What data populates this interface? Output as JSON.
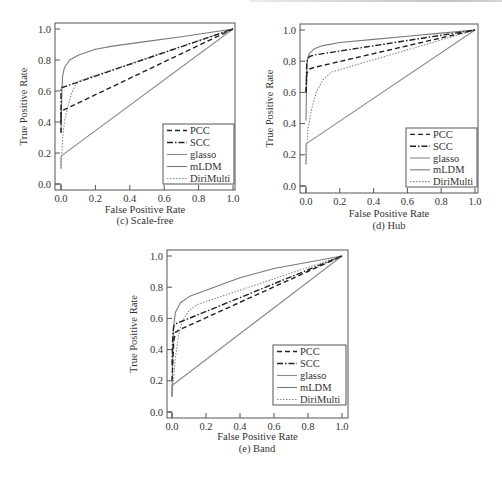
{
  "chart_data": [
    {
      "id": "c",
      "type": "line",
      "title": "",
      "caption": "(c)  Scale-free",
      "xlabel": "False Positive Rate",
      "ylabel": "True Positive Rate",
      "xlim": [
        0,
        1
      ],
      "ylim": [
        0,
        1
      ],
      "xticks": [
        "0.0",
        "0.2",
        "0.4",
        "0.6",
        "0.8",
        "1.0"
      ],
      "yticks": [
        "0.0",
        "0.2",
        "0.4",
        "0.6",
        "0.8",
        "1.0"
      ],
      "legend": {
        "position": "lower right",
        "entries": [
          "PCC",
          "SCC",
          "glasso",
          "mLDM",
          "DiriMulti"
        ]
      },
      "grid": false,
      "series": [
        {
          "name": "PCC",
          "style": "dashed",
          "color": "#222222",
          "x": [
            0.0,
            0.0,
            1.0
          ],
          "y": [
            0.33,
            0.47,
            1.0
          ]
        },
        {
          "name": "SCC",
          "style": "dashdot",
          "color": "#222222",
          "x": [
            0.0,
            0.0,
            1.0
          ],
          "y": [
            0.4,
            0.62,
            1.0
          ]
        },
        {
          "name": "glasso",
          "style": "solid",
          "color": "#8a8a8a",
          "x": [
            0.0,
            0.0,
            1.0
          ],
          "y": [
            0.1,
            0.18,
            1.0
          ]
        },
        {
          "name": "mLDM",
          "style": "solid",
          "color": "#7a7a7a",
          "x": [
            0.0,
            0.005,
            0.01,
            0.02,
            0.05,
            0.1,
            0.15,
            0.2,
            0.3,
            0.5,
            0.7,
            1.0
          ],
          "y": [
            0.33,
            0.6,
            0.7,
            0.75,
            0.8,
            0.83,
            0.85,
            0.87,
            0.89,
            0.92,
            0.95,
            1.0
          ]
        },
        {
          "name": "DiriMulti",
          "style": "dotted",
          "color": "#8a8a8a",
          "x": [
            0.0,
            0.01,
            0.02,
            0.04,
            0.06,
            0.08,
            0.1,
            0.12,
            1.0
          ],
          "y": [
            0.1,
            0.3,
            0.4,
            0.5,
            0.58,
            0.63,
            0.66,
            0.67,
            1.0
          ]
        }
      ]
    },
    {
      "id": "d",
      "type": "line",
      "title": "",
      "caption": "(d)  Hub",
      "xlabel": "False Positive Rate",
      "ylabel": "True Positive Rate",
      "xlim": [
        0,
        1
      ],
      "ylim": [
        0,
        1
      ],
      "xticks": [
        "0.0",
        "0.2",
        "0.4",
        "0.6",
        "0.8",
        "1.0"
      ],
      "yticks": [
        "0.0",
        "0.2",
        "0.4",
        "0.6",
        "0.8",
        "1.0"
      ],
      "legend": {
        "position": "lower right",
        "entries": [
          "PCC",
          "SCC",
          "glasso",
          "mLDM",
          "DiriMulti"
        ]
      },
      "grid": false,
      "series": [
        {
          "name": "PCC",
          "style": "dashed",
          "color": "#222222",
          "x": [
            0.0,
            0.005,
            0.02,
            0.05,
            1.0
          ],
          "y": [
            0.6,
            0.72,
            0.75,
            0.76,
            1.0
          ]
        },
        {
          "name": "SCC",
          "style": "dashdot",
          "color": "#222222",
          "x": [
            0.0,
            0.005,
            0.02,
            0.05,
            1.0
          ],
          "y": [
            0.6,
            0.8,
            0.83,
            0.84,
            1.0
          ]
        },
        {
          "name": "glasso",
          "style": "solid",
          "color": "#8a8a8a",
          "x": [
            0.0,
            0.0,
            1.0
          ],
          "y": [
            0.14,
            0.27,
            1.0
          ]
        },
        {
          "name": "mLDM",
          "style": "solid",
          "color": "#7a7a7a",
          "x": [
            0.0,
            0.005,
            0.01,
            0.02,
            0.05,
            0.1,
            0.2,
            0.4,
            0.6,
            0.8,
            1.0
          ],
          "y": [
            0.42,
            0.75,
            0.82,
            0.85,
            0.88,
            0.9,
            0.92,
            0.94,
            0.96,
            0.98,
            1.0
          ]
        },
        {
          "name": "DiriMulti",
          "style": "dotted",
          "color": "#8a8a8a",
          "x": [
            0.0,
            0.01,
            0.03,
            0.06,
            0.1,
            0.15,
            1.0
          ],
          "y": [
            0.14,
            0.35,
            0.48,
            0.6,
            0.68,
            0.73,
            1.0
          ]
        }
      ]
    },
    {
      "id": "e",
      "type": "line",
      "title": "",
      "caption": "(e)  Band",
      "xlabel": "False Positive Rate",
      "ylabel": "True Positive Rate",
      "xlim": [
        0,
        1
      ],
      "ylim": [
        0,
        1
      ],
      "xticks": [
        "0.0",
        "0.2",
        "0.4",
        "0.6",
        "0.8",
        "1.0"
      ],
      "yticks": [
        "0.0",
        "0.2",
        "0.4",
        "0.6",
        "0.8",
        "1.0"
      ],
      "legend": {
        "position": "lower right",
        "entries": [
          "PCC",
          "SCC",
          "glasso",
          "mLDM",
          "DiriMulti"
        ]
      },
      "grid": false,
      "series": [
        {
          "name": "PCC",
          "style": "dashed",
          "color": "#222222",
          "x": [
            0.0,
            0.01,
            0.02,
            0.05,
            1.0
          ],
          "y": [
            0.2,
            0.45,
            0.51,
            0.53,
            1.0
          ]
        },
        {
          "name": "SCC",
          "style": "dashdot",
          "color": "#222222",
          "x": [
            0.0,
            0.005,
            0.01,
            0.03,
            0.1,
            1.0
          ],
          "y": [
            0.3,
            0.5,
            0.55,
            0.57,
            0.6,
            1.0
          ]
        },
        {
          "name": "glasso",
          "style": "solid",
          "color": "#8a8a8a",
          "x": [
            0.0,
            0.0,
            1.0
          ],
          "y": [
            0.1,
            0.17,
            1.0
          ]
        },
        {
          "name": "mLDM",
          "style": "solid",
          "color": "#7a7a7a",
          "x": [
            0.0,
            0.005,
            0.01,
            0.02,
            0.05,
            0.1,
            0.2,
            0.4,
            0.6,
            0.8,
            1.0
          ],
          "y": [
            0.1,
            0.4,
            0.55,
            0.64,
            0.7,
            0.74,
            0.78,
            0.86,
            0.92,
            0.96,
            1.0
          ]
        },
        {
          "name": "DiriMulti",
          "style": "dotted",
          "color": "#8a8a8a",
          "x": [
            0.0,
            0.02,
            0.04,
            0.06,
            0.1,
            0.15,
            1.0
          ],
          "y": [
            0.1,
            0.35,
            0.5,
            0.58,
            0.65,
            0.69,
            1.0
          ]
        }
      ]
    }
  ],
  "layout": {
    "panels": [
      {
        "left": 0,
        "top": 0,
        "plot": {
          "x0": 61,
          "x1": 233,
          "y0": 184,
          "y1": 29,
          "fl": 55,
          "ft": 23,
          "fr": 235,
          "fb": 190
        },
        "legend": {
          "x": 163,
          "y": 124,
          "w": 71,
          "h": 60
        },
        "ylabel_x": 27,
        "xlabel_y": 213,
        "caption": {
          "x": 145,
          "y": 224
        }
      },
      {
        "left": 0,
        "top": 0,
        "plot": {
          "x0": 306,
          "x1": 475,
          "y0": 186,
          "y1": 30,
          "fl": 300,
          "ft": 24,
          "fr": 478,
          "fb": 193
        },
        "legend": {
          "x": 406,
          "y": 128,
          "w": 71,
          "h": 59
        },
        "ylabel_x": 273,
        "xlabel_y": 217,
        "caption": {
          "x": 389,
          "y": 229
        }
      },
      {
        "left": 0,
        "top": 0,
        "plot": {
          "x0": 172,
          "x1": 342,
          "y0": 412,
          "y1": 256,
          "fl": 167,
          "ft": 250,
          "fr": 348,
          "fb": 418
        },
        "legend": {
          "x": 273,
          "y": 345,
          "w": 73,
          "h": 60
        },
        "ylabel_x": 137,
        "xlabel_y": 440,
        "caption": {
          "x": 257,
          "y": 452
        }
      }
    ]
  }
}
